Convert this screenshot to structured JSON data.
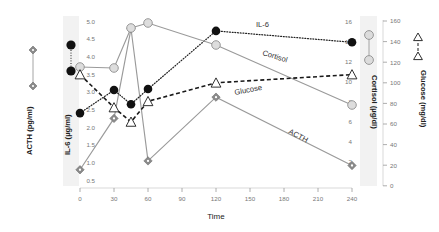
{
  "chart_data": {
    "type": "line",
    "title": "",
    "xlabel": "Time",
    "x_ticks": [
      0,
      30,
      60,
      90,
      120,
      150,
      180,
      210,
      240
    ],
    "xlim": [
      -8,
      250
    ],
    "grid": false,
    "legend_position": "inline-annotations",
    "axes": [
      {
        "id": "acth",
        "side": "left",
        "title": "ACTH (pg/ml)",
        "units": "pg/ml",
        "ticks": [],
        "ticklabels": [],
        "range": [
          0,
          100
        ]
      },
      {
        "id": "il6",
        "side": "left",
        "title": "IL-6 (µg/ml)",
        "units": "µg/ml",
        "ticks": [
          0.5,
          1.0,
          1.5,
          2.0,
          2.5,
          3.0,
          3.5,
          4.0,
          4.5,
          5.0
        ],
        "ticklabels": [
          "0.5",
          "1.0",
          "1.5",
          "2.0",
          "2.5",
          "3.0",
          "3.5",
          "4.0",
          "4.5",
          "5.0"
        ],
        "range": [
          0.5,
          5.0
        ]
      },
      {
        "id": "cortisol",
        "side": "right",
        "title": "Cortisol (µg/dl)",
        "units": "µg/dl",
        "ticks": [
          2,
          4,
          6,
          8,
          10,
          12,
          14,
          16
        ],
        "ticklabels": [
          "2",
          "4",
          "6",
          "8",
          "10",
          "12",
          "14",
          "16"
        ],
        "range": [
          1,
          16
        ]
      },
      {
        "id": "glucose",
        "side": "right",
        "title": "Glucose (mg/dl)",
        "units": "mg/dl",
        "ticks": [
          0,
          20,
          40,
          60,
          80,
          100,
          120,
          140,
          160
        ],
        "ticklabels": [
          "0",
          "20",
          "40",
          "60",
          "80",
          "100",
          "120",
          "140",
          "160"
        ],
        "range": [
          0,
          160
        ]
      }
    ],
    "series": [
      {
        "name": "ACTH",
        "label": "ACTH",
        "axis": "acth",
        "marker": "diamond",
        "marker_fill": "#8a8a8a",
        "line_style": "solid",
        "color": "#9a9a9a",
        "x": [
          0,
          30,
          45,
          60,
          120,
          240
        ],
        "y": [
          0.8,
          2.25,
          4.78,
          1.05,
          2.85,
          0.92
        ],
        "y_axis_values_in_il6_scale": true
      },
      {
        "name": "IL-6",
        "label": "IL-6",
        "axis": "il6",
        "marker": "circle-filled",
        "marker_fill": "#111111",
        "line_style": "dotted",
        "color": "#222222",
        "x": [
          0,
          30,
          45,
          60,
          120,
          240
        ],
        "y": [
          2.4,
          3.05,
          2.65,
          3.08,
          4.72,
          4.4
        ]
      },
      {
        "name": "Cortisol",
        "label": "Cortisol",
        "axis": "cortisol",
        "marker": "circle-open",
        "marker_fill": "#dddddd",
        "line_style": "solid",
        "color": "#9a9a9a",
        "x": [
          0,
          30,
          45,
          60,
          120,
          240
        ],
        "y": [
          11.4,
          11.3,
          15.3,
          15.8,
          13.6,
          7.6
        ]
      },
      {
        "name": "Glucose",
        "label": "Glucose",
        "axis": "glucose",
        "marker": "triangle-open",
        "marker_fill": "#ffffff",
        "line_style": "dashed",
        "color": "#1a1a1a",
        "x": [
          0,
          30,
          45,
          60,
          120,
          240
        ],
        "y": [
          108,
          76,
          62,
          82,
          100,
          108
        ]
      }
    ],
    "annotations": [
      {
        "text": "IL-6",
        "x": 160,
        "y_px": 24
      },
      {
        "text": "Cortisol",
        "x": 168,
        "y_px": 58
      },
      {
        "text": "Glucose",
        "x": 150,
        "y_px": 88
      },
      {
        "text": "ACTH",
        "x": 190,
        "y_px": 133
      }
    ]
  },
  "left_legends": [
    {
      "title": "ACTH (pg/ml)",
      "marker": "diamond",
      "line_style": "solid"
    },
    {
      "title": "IL-6 (µg/ml)",
      "marker": "circle-filled",
      "line_style": "dotted"
    }
  ],
  "right_legends": [
    {
      "title": "Cortisol (µg/dl)",
      "marker": "circle-open",
      "line_style": "solid"
    },
    {
      "title": "Glucose (mg/dl)",
      "marker": "triangle-open",
      "line_style": "dashed"
    }
  ],
  "colors": {
    "background": "#ffffff",
    "gray_line": "#9a9a9a",
    "dark_line": "#1a1a1a",
    "tick_text": "#777777",
    "axis_text": "#222222",
    "legend_band": "#f2f2f2"
  }
}
